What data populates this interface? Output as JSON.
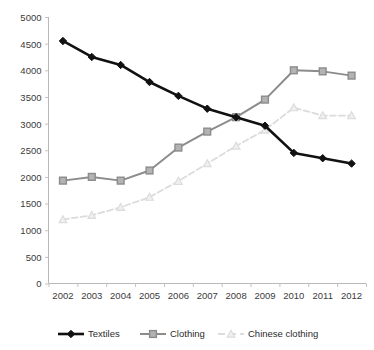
{
  "chart_data": {
    "type": "line",
    "title": "",
    "xlabel": "",
    "ylabel": "",
    "x": [
      2002,
      2003,
      2004,
      2005,
      2006,
      2007,
      2008,
      2009,
      2010,
      2011,
      2012
    ],
    "categories": [
      "2002",
      "2003",
      "2004",
      "2005",
      "2006",
      "2007",
      "2008",
      "2009",
      "2010",
      "2011",
      "2012"
    ],
    "ylim": [
      0,
      5000
    ],
    "yticks": [
      0,
      500,
      1000,
      1500,
      2000,
      2500,
      3000,
      3500,
      4000,
      4500,
      5000
    ],
    "ytick_labels": [
      "0",
      "500",
      "1000",
      "1500",
      "2000",
      "2500",
      "3000",
      "3500",
      "4000",
      "4500",
      "5000"
    ],
    "grid": false,
    "legend_position": "bottom",
    "series": [
      {
        "name": "Textiles",
        "marker": "diamond",
        "color": "#111111",
        "line_style": "solid",
        "values": [
          4550,
          4250,
          4100,
          3780,
          3520,
          3280,
          3120,
          2960,
          2450,
          2350,
          2250
        ]
      },
      {
        "name": "Clothing",
        "marker": "square",
        "color": "#8c8c8c",
        "line_style": "solid",
        "values": [
          1930,
          2000,
          1930,
          2120,
          2550,
          2850,
          3120,
          3450,
          4000,
          3980,
          3900
        ]
      },
      {
        "name": "Chinese clothing",
        "marker": "triangle",
        "color": "#dcdcdc",
        "line_style": "dashed",
        "values": [
          1200,
          1280,
          1430,
          1620,
          1920,
          2250,
          2580,
          2880,
          3300,
          3150,
          3150
        ]
      }
    ]
  },
  "legend": {
    "items": [
      {
        "label": "Textiles"
      },
      {
        "label": "Clothing"
      },
      {
        "label": "Chinese clothing"
      }
    ]
  },
  "colors": {
    "textiles": "#111111",
    "clothing": "#8c8c8c",
    "chinese_clothing": "#dcdcdc",
    "axis": "#b9b9b9",
    "text": "#3b3b3b",
    "background": "#ffffff"
  }
}
